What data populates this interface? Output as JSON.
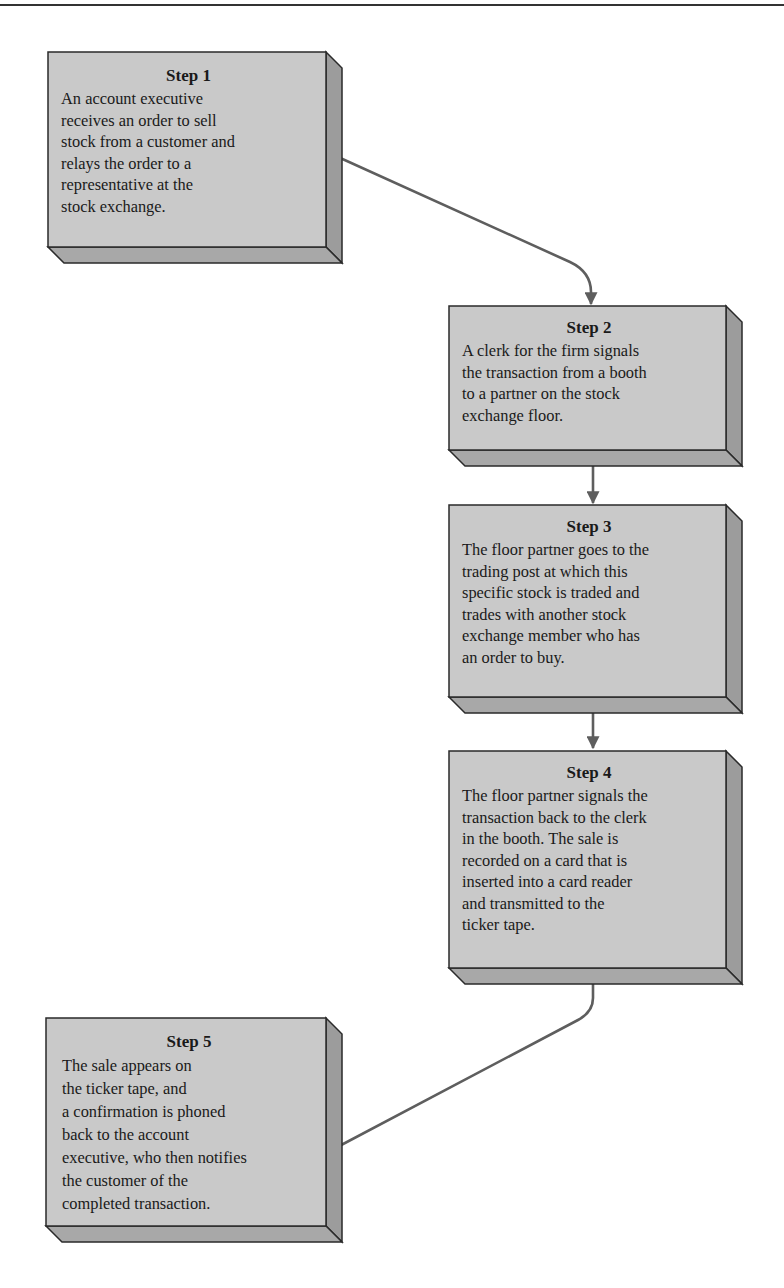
{
  "colors": {
    "front_face": "#c9c9c9",
    "side_face": "#9c9c9c",
    "bottom_face": "#a8a8a8",
    "outline": "#2a2a2a",
    "arrow": "#5e5e5e"
  },
  "steps": [
    {
      "title": "Step 1",
      "text": "An account executive\nreceives an order to sell\nstock from a customer and\nrelays the order to a\nrepresentative at the\nstock exchange."
    },
    {
      "title": "Step 2",
      "text": "A clerk for the firm signals\nthe transaction from a booth\nto a partner on the stock\nexchange floor."
    },
    {
      "title": "Step 3",
      "text": "The floor partner goes to the\ntrading post at which this\nspecific stock is traded and\ntrades with another stock\nexchange member who has\nan order to buy."
    },
    {
      "title": "Step 4",
      "text": "The floor partner signals the\ntransaction back to the clerk\nin the booth. The sale is\nrecorded on a card that is\ninserted into a card reader\nand transmitted to the\nticker tape."
    },
    {
      "title": "Step 5",
      "text": "The sale appears on\nthe ticker tape, and\na confirmation is phoned\nback to the account\nexecutive, who then notifies\nthe customer of the\ncompleted transaction."
    }
  ],
  "connectors": [
    {
      "from": "Step 1",
      "to": "Step 2"
    },
    {
      "from": "Step 2",
      "to": "Step 3"
    },
    {
      "from": "Step 3",
      "to": "Step 4"
    },
    {
      "from": "Step 4",
      "to": "Step 5"
    }
  ]
}
